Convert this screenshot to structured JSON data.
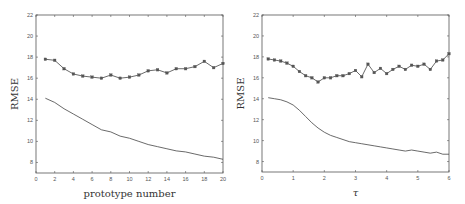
{
  "chart_data": [
    {
      "type": "line",
      "title": "",
      "xlabel": "prototype number",
      "ylabel": "RMSE",
      "xlim": [
        0,
        20
      ],
      "ylim": [
        7,
        22
      ],
      "xticks": [
        0,
        2,
        4,
        6,
        8,
        10,
        12,
        14,
        16,
        18,
        20
      ],
      "yticks": [
        8,
        10,
        12,
        14,
        16,
        18,
        20,
        22
      ],
      "grid": false,
      "legend": null,
      "x": [
        1,
        2,
        3,
        4,
        5,
        6,
        7,
        8,
        9,
        10,
        11,
        12,
        13,
        14,
        15,
        16,
        17,
        18,
        19,
        20
      ],
      "series": [
        {
          "name": "upper (with markers)",
          "marker": "square",
          "values": [
            17.8,
            17.7,
            16.9,
            16.4,
            16.2,
            16.1,
            16.0,
            16.3,
            16.0,
            16.1,
            16.3,
            16.7,
            16.8,
            16.5,
            16.9,
            16.9,
            17.1,
            17.6,
            17.0,
            17.4
          ]
        },
        {
          "name": "lower (solid)",
          "marker": "none",
          "values": [
            14.1,
            13.7,
            13.1,
            12.6,
            12.1,
            11.6,
            11.1,
            10.9,
            10.5,
            10.3,
            10.0,
            9.7,
            9.5,
            9.3,
            9.1,
            9.0,
            8.8,
            8.6,
            8.5,
            8.3
          ]
        }
      ]
    },
    {
      "type": "line",
      "title": "",
      "xlabel": "τ",
      "ylabel": "RMSE",
      "xlim": [
        0,
        6
      ],
      "ylim": [
        7,
        22
      ],
      "xticks": [
        0,
        1,
        2,
        3,
        4,
        5,
        6
      ],
      "yticks": [
        8,
        10,
        12,
        14,
        16,
        18,
        20,
        22
      ],
      "grid": false,
      "legend": null,
      "x": [
        0.2,
        0.4,
        0.6,
        0.8,
        1.0,
        1.2,
        1.4,
        1.6,
        1.8,
        2.0,
        2.2,
        2.4,
        2.6,
        2.8,
        3.0,
        3.2,
        3.4,
        3.6,
        3.8,
        4.0,
        4.2,
        4.4,
        4.6,
        4.8,
        5.0,
        5.2,
        5.4,
        5.6,
        5.8,
        6.0
      ],
      "series": [
        {
          "name": "upper (with markers)",
          "marker": "square",
          "values": [
            17.8,
            17.7,
            17.6,
            17.4,
            17.1,
            16.6,
            16.2,
            16.0,
            15.6,
            16.0,
            16.0,
            16.2,
            16.2,
            16.4,
            16.7,
            16.1,
            17.3,
            16.5,
            16.9,
            16.4,
            16.8,
            17.1,
            16.8,
            17.2,
            17.1,
            17.3,
            16.8,
            17.6,
            17.7,
            18.3
          ]
        },
        {
          "name": "lower (solid)",
          "marker": "none",
          "values": [
            14.1,
            14.0,
            13.9,
            13.7,
            13.4,
            12.9,
            12.3,
            11.7,
            11.2,
            10.8,
            10.5,
            10.3,
            10.1,
            9.9,
            9.8,
            9.7,
            9.6,
            9.5,
            9.4,
            9.3,
            9.2,
            9.1,
            9.0,
            9.1,
            9.0,
            8.9,
            8.8,
            8.9,
            8.7,
            8.7
          ]
        }
      ]
    }
  ],
  "panels": [
    {
      "xlabel": "prototype number",
      "ylabel": "RMSE"
    },
    {
      "xlabel": "τ",
      "ylabel": "RMSE"
    }
  ],
  "style": {
    "axis_color": "#555555",
    "line_color": "#444444",
    "marker_color": "#555555"
  }
}
